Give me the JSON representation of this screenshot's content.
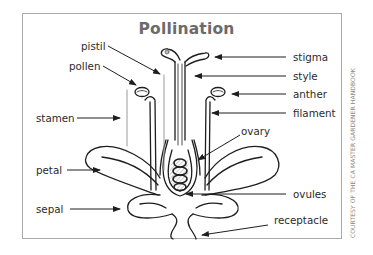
{
  "title": "Pollination",
  "credit": "COURTESY OF THE CA MASTER GARDENER HANDBOOK",
  "labels": {
    "pistil": "pistil",
    "pollen": "pollen",
    "stamen": "stamen",
    "petal": "petal",
    "sepal": "sepal",
    "stigma": "stigma",
    "style": "style",
    "anther": "anther",
    "filament": "filament",
    "ovary": "ovary",
    "ovules": "ovules",
    "receptacle": "receptacle"
  },
  "colors": {
    "title": "#6b6b6b",
    "line": "#1e1e1e",
    "frame": "#a9a9a9"
  }
}
